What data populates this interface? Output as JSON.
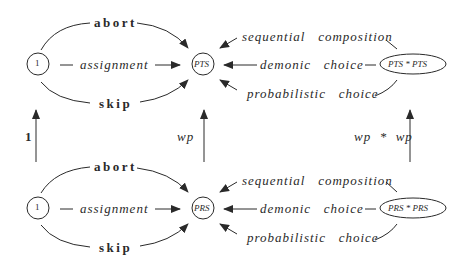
{
  "diagram": {
    "top_row": {
      "source_node": "1",
      "target_node": "PTS",
      "product_node": "PTS * PTS",
      "left_edges": {
        "upper": "abort",
        "middle": "assignment",
        "lower": "skip"
      },
      "right_edges": {
        "upper": "sequential   composition",
        "middle": "demonic   choice",
        "lower": "probabilistic   choice"
      }
    },
    "bottom_row": {
      "source_node": "1",
      "target_node": "PRS",
      "product_node": "PRS * PRS",
      "left_edges": {
        "upper": "abort",
        "middle": "assignment",
        "lower": "skip"
      },
      "right_edges": {
        "upper": "sequential   composition",
        "middle": "demonic   choice",
        "lower": "probabilistic   choice"
      }
    },
    "vertical_maps": {
      "left": "1",
      "middle": "wp",
      "right": "wp  *  wp"
    },
    "colors": {
      "ink": "#2a2a2a",
      "background": "#ffffff"
    }
  }
}
